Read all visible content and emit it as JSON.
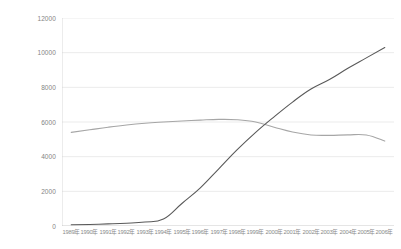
{
  "clipped_header": {
    "fragments": [
      "",
      ""
    ]
  },
  "chart_data": {
    "type": "line",
    "title": "",
    "xlabel": "",
    "ylabel": "",
    "ylim": [
      0,
      12000
    ],
    "ytick_labels": [
      "12000",
      "10000",
      "8000",
      "6000",
      "4000",
      "2000",
      "0"
    ],
    "yticks": [
      12000,
      10000,
      8000,
      6000,
      4000,
      2000,
      0
    ],
    "grid": true,
    "legend": "none",
    "categories": [
      "1989年",
      "1990年",
      "1991年",
      "1992年",
      "1993年",
      "1994年",
      "1995年",
      "1996年",
      "1997年",
      "1998年",
      "1999年",
      "2000年",
      "2001年",
      "2002年",
      "2003年",
      "2004年",
      "2005年",
      "2006年"
    ],
    "series": [
      {
        "name": "series-1",
        "color": "#a6a6a6",
        "values": [
          5400,
          5550,
          5700,
          5830,
          5930,
          6000,
          6060,
          6110,
          6150,
          6130,
          6000,
          5700,
          5420,
          5250,
          5230,
          5260,
          5250,
          4900
        ]
      },
      {
        "name": "series-2",
        "color": "#595959",
        "values": [
          70,
          90,
          120,
          160,
          230,
          400,
          1300,
          2200,
          3300,
          4400,
          5400,
          6300,
          7150,
          7900,
          8450,
          9100,
          9700,
          10300
        ]
      }
    ]
  }
}
